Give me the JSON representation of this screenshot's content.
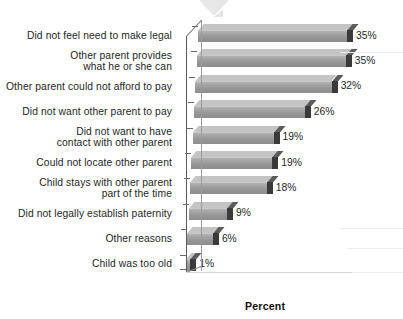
{
  "chart_data": {
    "type": "bar",
    "orientation": "horizontal",
    "title": "",
    "subtitle": "",
    "xlabel": "Percent",
    "ylabel": "",
    "xlim": [
      0,
      38
    ],
    "grid": false,
    "legend": null,
    "value_suffix": "%",
    "categories": [
      "Did not feel need to make legal",
      "Other parent provides\nwhat he or she can",
      "Other parent could not afford to pay",
      "Did not want other parent to pay",
      "Did not want to have\ncontact with other parent",
      "Could not locate other parent",
      "Child stays with other parent\npart of the time",
      "Did not legally establish paternity",
      "Other reasons",
      "Child was too old"
    ],
    "values": [
      35,
      35,
      32,
      26,
      19,
      19,
      18,
      9,
      6,
      1
    ],
    "data_labels": [
      "35%",
      "35%",
      "32%",
      "26%",
      "19%",
      "19%",
      "18%",
      "9%",
      "6%",
      "1%"
    ],
    "colors": {
      "bar_face": "#9a9a9a",
      "bar_top": "#c4c4c4",
      "bar_end_cap": "#3a3a3a",
      "axis": "#5a5a5a",
      "text": "#1f1f1f",
      "background": "#ffffff"
    }
  },
  "axis": {
    "x_title": "Percent"
  }
}
